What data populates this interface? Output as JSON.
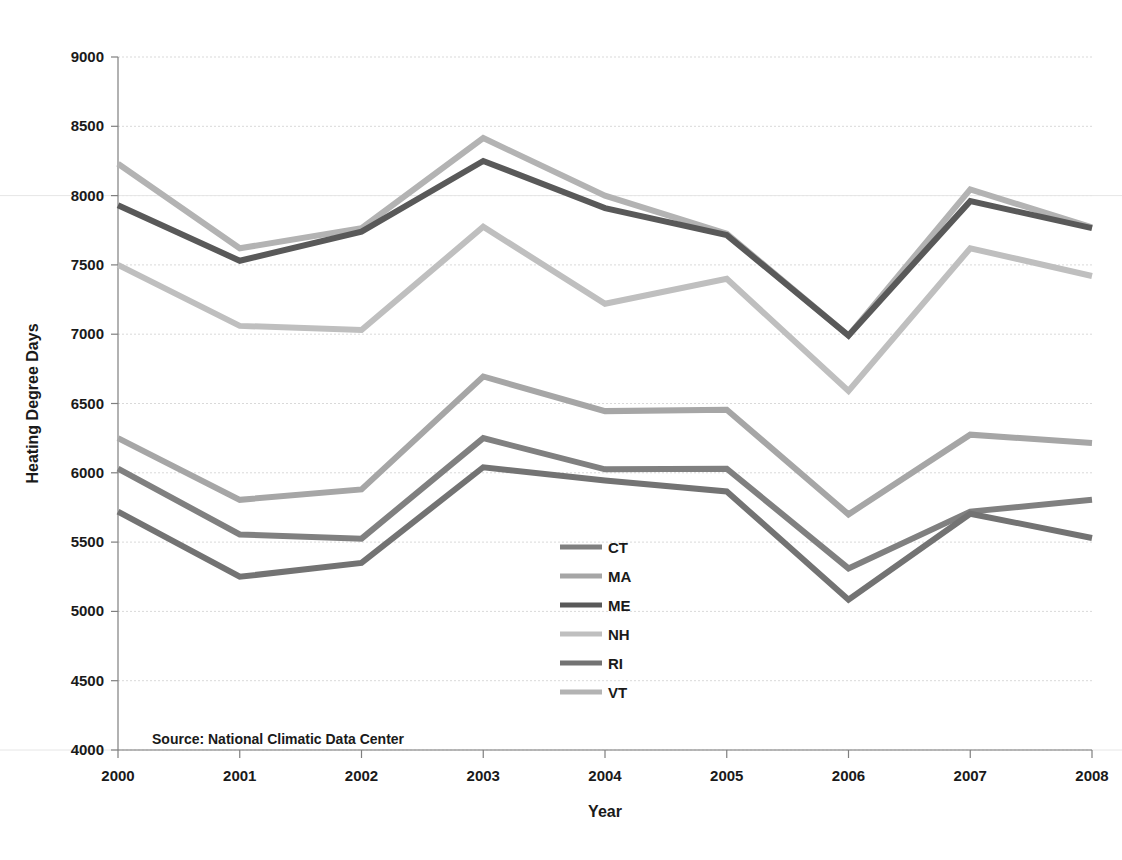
{
  "chart_data": {
    "type": "line",
    "title": "",
    "xlabel": "Year",
    "ylabel": "Heating Degree Days",
    "x": [
      2000,
      2001,
      2002,
      2003,
      2004,
      2005,
      2006,
      2007,
      2008
    ],
    "categories": [
      "2000",
      "2001",
      "2002",
      "2003",
      "2004",
      "2005",
      "2006",
      "2007",
      "2008"
    ],
    "xlim": [
      2000,
      2008
    ],
    "ylim": [
      4000,
      9000
    ],
    "ytick_labels": [
      "4000",
      "4500",
      "5000",
      "5500",
      "6000",
      "6500",
      "7000",
      "7500",
      "8000",
      "8500",
      "9000"
    ],
    "yticks": [
      4000,
      4500,
      5000,
      5500,
      6000,
      6500,
      7000,
      7500,
      8000,
      8500,
      9000
    ],
    "grid": true,
    "legend_position": "center",
    "annotation": "Source: National Climatic Data Center",
    "series": [
      {
        "name": "CT",
        "color": "#808080",
        "values": [
          6030,
          5555,
          5525,
          6250,
          6025,
          6030,
          5310,
          5720,
          5805
        ]
      },
      {
        "name": "MA",
        "color": "#a6a6a6",
        "values": [
          6250,
          5805,
          5880,
          6695,
          6445,
          6455,
          5700,
          6275,
          6215
        ]
      },
      {
        "name": "ME",
        "color": "#595959",
        "values": [
          7930,
          7530,
          7740,
          8250,
          7910,
          7715,
          6990,
          7960,
          7765
        ]
      },
      {
        "name": "NH",
        "color": "#bfbfbf",
        "values": [
          7500,
          7060,
          7030,
          7775,
          7220,
          7400,
          6590,
          7620,
          7420
        ]
      },
      {
        "name": "RI",
        "color": "#737373",
        "values": [
          5720,
          5250,
          5350,
          6040,
          5945,
          5865,
          5085,
          5705,
          5530
        ]
      },
      {
        "name": "VT",
        "color": "#b3b3b3",
        "values": [
          8230,
          7620,
          7765,
          8415,
          8000,
          7725,
          6990,
          8045,
          7770
        ]
      }
    ]
  },
  "axes": {
    "y_title": "Heating Degree Days",
    "x_title": "Year"
  },
  "source": {
    "text": "Source: National Climatic Data Center"
  },
  "legend": {
    "entries": [
      {
        "label": "CT"
      },
      {
        "label": "MA"
      },
      {
        "label": "ME"
      },
      {
        "label": "NH"
      },
      {
        "label": "RI"
      },
      {
        "label": "VT"
      }
    ]
  }
}
